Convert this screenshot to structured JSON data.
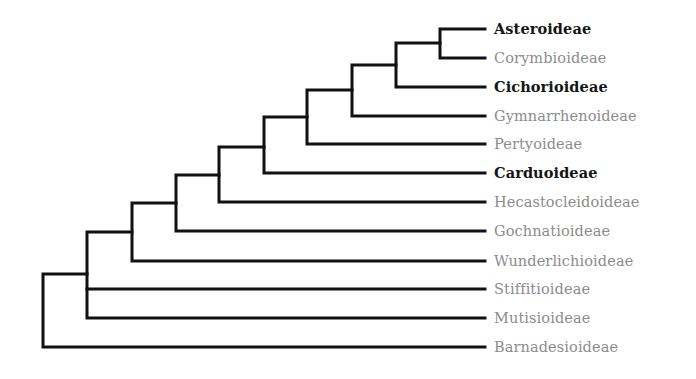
{
  "diagram": {
    "type": "phylogenetic-tree",
    "line_color": "#111111",
    "highlight_color": "#151515",
    "dim_color": "#8c8c8c",
    "taxa": [
      {
        "name": "Asteroideae",
        "highlight": true
      },
      {
        "name": "Corymbioideae",
        "highlight": false
      },
      {
        "name": "Cichorioideae",
        "highlight": true
      },
      {
        "name": "Gymnarrhenoideae",
        "highlight": false
      },
      {
        "name": "Pertyoideae",
        "highlight": false
      },
      {
        "name": "Carduoideae",
        "highlight": true
      },
      {
        "name": "Hecastocleidoideae",
        "highlight": false
      },
      {
        "name": "Gochnatioideae",
        "highlight": false
      },
      {
        "name": "Wunderlichioideae",
        "highlight": false
      },
      {
        "name": "Stiffitioideae",
        "highlight": false
      },
      {
        "name": "Mutisioideae",
        "highlight": false
      },
      {
        "name": "Barnadesioideae",
        "highlight": false
      }
    ],
    "topology": "(Barnadesioideae,((Mutisioideae,Stiffitioideae),(Wunderlichioideae,(Gochnatioideae,(Hecastocleidoideae,(Carduoideae,(Pertyoideae,(Gymnarrhenoideae,(Cichorioideae,(Corymbioideae,Asteroideae))))))))));"
  }
}
